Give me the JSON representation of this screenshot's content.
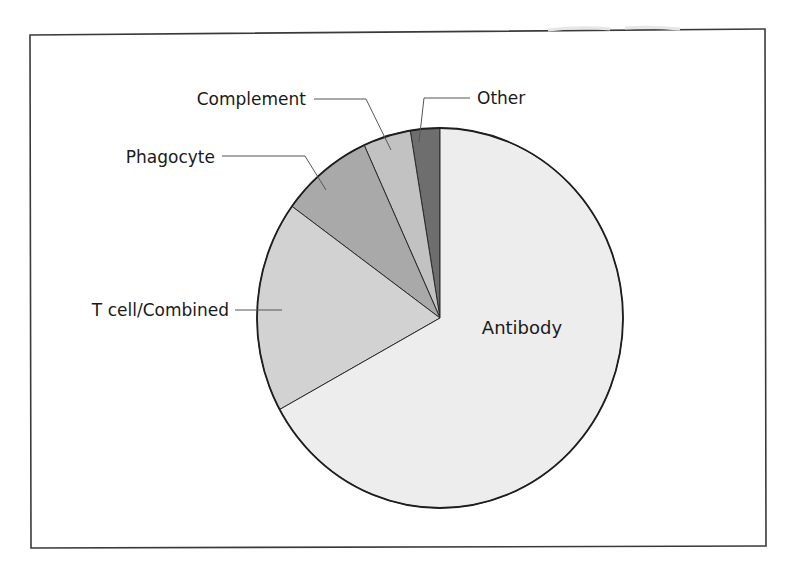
{
  "chart_data": {
    "type": "pie",
    "title": "",
    "start_angle_deg": 0,
    "direction": "counterclockwise-from-top",
    "categories": [
      "Antibody",
      "T cell/Combined",
      "Phagocyte",
      "Complement",
      "Other"
    ],
    "values": [
      67,
      18,
      8.2,
      4.2,
      2.6
    ],
    "unit": "percent (estimated from slice angles)",
    "colors": [
      "#ededed",
      "#d2d2d2",
      "#a9a9a9",
      "#c2c2c2",
      "#6e6e6e"
    ],
    "labels": {
      "antibody": "Antibody",
      "tcell": "T cell/Combined",
      "phagocyte": "Phagocyte",
      "complement": "Complement",
      "other": "Other"
    },
    "legend": "none (callout labels with leader lines)",
    "grid": false
  }
}
